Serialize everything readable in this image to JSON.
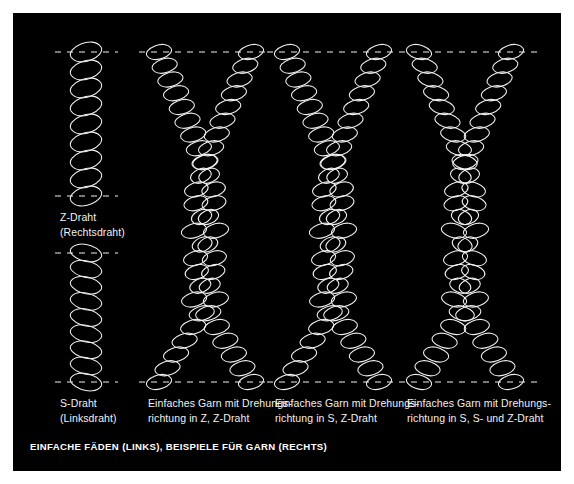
{
  "figure": {
    "background_color": "#ffffff",
    "panel_color": "#000000",
    "line_color": "#f0f0f0",
    "text_color": "#f2f2f2",
    "caption": "EINFACHE FÄDEN (LINKS), BEISPIELE FÜR GARN (RECHTS)"
  },
  "labels": {
    "z_draht": "Z-Draht\n(Rechtsdraht)",
    "s_draht": "S-Draht\n(Linksdraht)",
    "col2": "Einfaches Garn mit Drehungs-\nrichtung in Z, Z-Draht",
    "col3": "Einfaches Garn mit Drehungs-\nrichtung in S, Z-Draht",
    "col4": "Einfaches Garn mit Drehungs-\nrichtung in S, S- und Z-Draht"
  },
  "diagram": {
    "panel": {
      "x": 13,
      "y": 13,
      "width": 548,
      "height": 458
    },
    "guides": {
      "dash": "6 6",
      "stroke_width": 1,
      "rows": [
        {
          "name": "top-guide",
          "y": 39
        },
        {
          "name": "mid-guide",
          "y": 183
        },
        {
          "name": "lower-guide",
          "y": 240
        },
        {
          "name": "bottom-guide",
          "y": 369
        }
      ]
    },
    "columns": [
      {
        "name": "single-threads",
        "cx": 73,
        "guide_x1": 42,
        "guide_x2": 105,
        "strands": [
          {
            "name": "z-draht-coil",
            "handedness": "Z",
            "y1": 39,
            "y2": 183,
            "radius": 15,
            "pitch": 17
          },
          {
            "name": "s-draht-coil",
            "handedness": "S",
            "y1": 240,
            "y2": 369,
            "radius": 15,
            "pitch": 17
          }
        ]
      },
      {
        "name": "yarn-z-z",
        "cx": 192,
        "guide_x1": 126,
        "guide_x2": 258,
        "ply_handedness": "Z",
        "strand_handedness": "Z",
        "spread": 46,
        "y_top": 39,
        "y_join_top": 150,
        "y_join_bottom": 295,
        "y_bottom": 369,
        "radius": 12,
        "pitch": 14
      },
      {
        "name": "yarn-s-z",
        "cx": 320,
        "guide_x1": 254,
        "guide_x2": 386,
        "ply_handedness": "S",
        "strand_handedness": "Z",
        "spread": 46,
        "y_top": 39,
        "y_join_top": 150,
        "y_join_bottom": 295,
        "y_bottom": 369,
        "radius": 12,
        "pitch": 14
      },
      {
        "name": "yarn-s-sz",
        "cx": 452,
        "guide_x1": 386,
        "guide_x2": 528,
        "ply_handedness": "S",
        "strand_handedness": "mixed",
        "spread": 46,
        "y_top": 39,
        "y_join_top": 150,
        "y_join_bottom": 295,
        "y_bottom": 369,
        "radius": 12,
        "pitch": 14
      }
    ]
  }
}
